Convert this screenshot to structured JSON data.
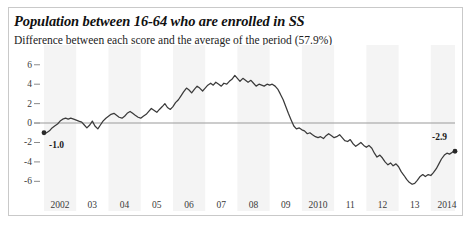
{
  "header": {
    "title": "Population between 16-64 who are enrolled in SS",
    "subtitle": "Difference between each score and the average of the period (57.9%)"
  },
  "annotations": {
    "start_label": "-1.0",
    "end_label": "-2.9"
  },
  "chart_data": {
    "type": "line",
    "title": "Population between 16-64 who are enrolled in SS",
    "subtitle": "Difference between each score and the average of the period (57.9%)",
    "xlabel": "",
    "ylabel": "",
    "xlim": [
      2002.0,
      2014.75
    ],
    "ylim": [
      -7.2,
      6.8
    ],
    "yticks": [
      6,
      4,
      2,
      0,
      -2,
      -4,
      -6
    ],
    "ytick_labels": [
      "6",
      "4",
      "2",
      "0",
      "-2",
      "-4",
      "-6"
    ],
    "xticks": [
      2002,
      2003,
      2004,
      2005,
      2006,
      2007,
      2008,
      2009,
      2010,
      2011,
      2012,
      2013,
      2014
    ],
    "xtick_labels": [
      "2002",
      "03",
      "04",
      "05",
      "06",
      "07",
      "08",
      "09",
      "2010",
      "11",
      "12",
      "13",
      "2014"
    ],
    "grid": false,
    "zero_line": 0,
    "legend": null,
    "line_color": "#3a3a3a",
    "zero_line_color": "#999999",
    "band_color": "#f4f4f4",
    "bands": [
      [
        2002.0,
        2003.0
      ],
      [
        2004.0,
        2005.0
      ],
      [
        2006.0,
        2007.0
      ],
      [
        2008.0,
        2009.0
      ],
      [
        2010.0,
        2011.0
      ],
      [
        2012.0,
        2013.0
      ],
      [
        2014.0,
        2014.75
      ]
    ],
    "markers": [
      {
        "x": 2002.0,
        "y": -1.0,
        "label": "-1.0",
        "label_pos": "below-right"
      },
      {
        "x": 2014.75,
        "y": -2.9,
        "label": "-2.9",
        "label_pos": "above-left"
      }
    ],
    "x": [
      2002.0,
      2002.08,
      2002.17,
      2002.25,
      2002.33,
      2002.42,
      2002.5,
      2002.58,
      2002.67,
      2002.75,
      2002.83,
      2002.92,
      2003.0,
      2003.08,
      2003.17,
      2003.25,
      2003.33,
      2003.42,
      2003.5,
      2003.58,
      2003.67,
      2003.75,
      2003.83,
      2003.92,
      2004.0,
      2004.08,
      2004.17,
      2004.25,
      2004.33,
      2004.42,
      2004.5,
      2004.58,
      2004.67,
      2004.75,
      2004.83,
      2004.92,
      2005.0,
      2005.08,
      2005.17,
      2005.25,
      2005.33,
      2005.42,
      2005.5,
      2005.58,
      2005.67,
      2005.75,
      2005.83,
      2005.92,
      2006.0,
      2006.08,
      2006.17,
      2006.25,
      2006.33,
      2006.42,
      2006.5,
      2006.58,
      2006.67,
      2006.75,
      2006.83,
      2006.92,
      2007.0,
      2007.08,
      2007.17,
      2007.25,
      2007.33,
      2007.42,
      2007.5,
      2007.58,
      2007.67,
      2007.75,
      2007.83,
      2007.92,
      2008.0,
      2008.08,
      2008.17,
      2008.25,
      2008.33,
      2008.42,
      2008.5,
      2008.58,
      2008.67,
      2008.75,
      2008.83,
      2008.92,
      2009.0,
      2009.08,
      2009.17,
      2009.25,
      2009.33,
      2009.42,
      2009.5,
      2009.58,
      2009.67,
      2009.75,
      2009.83,
      2009.92,
      2010.0,
      2010.08,
      2010.17,
      2010.25,
      2010.33,
      2010.42,
      2010.5,
      2010.58,
      2010.67,
      2010.75,
      2010.83,
      2010.92,
      2011.0,
      2011.08,
      2011.17,
      2011.25,
      2011.33,
      2011.42,
      2011.5,
      2011.58,
      2011.67,
      2011.75,
      2011.83,
      2011.92,
      2012.0,
      2012.08,
      2012.17,
      2012.25,
      2012.33,
      2012.42,
      2012.5,
      2012.58,
      2012.67,
      2012.75,
      2012.83,
      2012.92,
      2013.0,
      2013.08,
      2013.17,
      2013.25,
      2013.33,
      2013.42,
      2013.5,
      2013.58,
      2013.67,
      2013.75,
      2013.83,
      2013.92,
      2014.0,
      2014.08,
      2014.17,
      2014.25,
      2014.33,
      2014.42,
      2014.5,
      2014.58,
      2014.67,
      2014.75
    ],
    "values": [
      -1.0,
      -1.0,
      -0.8,
      -0.5,
      -0.3,
      -0.1,
      0.2,
      0.4,
      0.5,
      0.4,
      0.5,
      0.4,
      0.3,
      0.2,
      0.1,
      -0.2,
      -0.5,
      -0.2,
      0.2,
      -0.3,
      -0.6,
      -0.2,
      0.2,
      0.5,
      0.7,
      0.9,
      1.0,
      0.8,
      0.6,
      0.5,
      0.7,
      1.0,
      1.2,
      1.0,
      0.8,
      0.6,
      0.5,
      0.7,
      0.9,
      1.2,
      1.5,
      1.3,
      1.1,
      1.4,
      1.7,
      2.0,
      1.6,
      1.4,
      1.7,
      2.1,
      2.4,
      2.8,
      3.2,
      3.6,
      3.4,
      3.1,
      3.5,
      3.8,
      3.6,
      3.3,
      3.6,
      3.9,
      4.1,
      3.9,
      4.2,
      4.0,
      3.8,
      4.1,
      4.0,
      4.3,
      4.5,
      4.9,
      4.6,
      4.3,
      4.6,
      4.4,
      4.2,
      4.4,
      4.1,
      3.8,
      4.0,
      3.9,
      3.8,
      4.0,
      3.9,
      4.0,
      3.8,
      3.5,
      3.0,
      2.4,
      1.7,
      1.0,
      0.3,
      -0.3,
      -0.6,
      -0.5,
      -0.7,
      -0.8,
      -1.1,
      -1.0,
      -1.2,
      -1.4,
      -1.5,
      -1.4,
      -1.6,
      -1.3,
      -1.1,
      -1.3,
      -1.5,
      -1.4,
      -1.2,
      -1.5,
      -1.8,
      -1.9,
      -1.7,
      -2.1,
      -2.4,
      -2.2,
      -2.0,
      -2.3,
      -2.5,
      -2.3,
      -2.6,
      -3.1,
      -3.5,
      -3.3,
      -3.6,
      -4.0,
      -4.3,
      -4.1,
      -4.4,
      -4.2,
      -4.5,
      -5.0,
      -5.4,
      -5.8,
      -6.1,
      -6.3,
      -6.2,
      -5.9,
      -5.5,
      -5.3,
      -5.5,
      -5.3,
      -5.4,
      -5.1,
      -4.7,
      -4.2,
      -3.7,
      -3.3,
      -3.1,
      -3.2,
      -3.0,
      -2.9
    ]
  }
}
